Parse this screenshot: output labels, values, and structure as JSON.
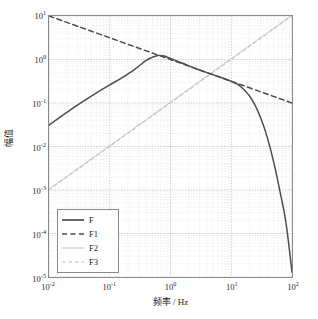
{
  "chart_data": {
    "type": "line",
    "title": "",
    "xlabel": "频率 / Hz",
    "ylabel": "幅值",
    "xscale": "log",
    "yscale": "log",
    "xlim": [
      0.01,
      100
    ],
    "ylim": [
      1e-05,
      10
    ],
    "grid": true,
    "minor_grid": true,
    "legend_position": "lower left",
    "xticks": [
      {
        "value": 0.01,
        "label": "10",
        "exponent": "-2"
      },
      {
        "value": 0.1,
        "label": "10",
        "exponent": "-1"
      },
      {
        "value": 1,
        "label": "10",
        "exponent": "0"
      },
      {
        "value": 10,
        "label": "10",
        "exponent": "1"
      },
      {
        "value": 100,
        "label": "10",
        "exponent": "2"
      }
    ],
    "yticks": [
      {
        "value": 10,
        "label": "10",
        "exponent": "1"
      },
      {
        "value": 1,
        "label": "10",
        "exponent": "0"
      },
      {
        "value": 0.1,
        "label": "10",
        "exponent": "-1"
      },
      {
        "value": 0.01,
        "label": "10",
        "exponent": "-2"
      },
      {
        "value": 0.001,
        "label": "10",
        "exponent": "-3"
      },
      {
        "value": 0.0001,
        "label": "10",
        "exponent": "-4"
      },
      {
        "value": 1e-05,
        "label": "10",
        "exponent": "-5"
      }
    ],
    "series": [
      {
        "name": "F",
        "style": "solid",
        "color": "#4d4d4d",
        "width": 1.5,
        "x": [
          0.01,
          0.0158,
          0.0251,
          0.0398,
          0.0631,
          0.1,
          0.158,
          0.251,
          0.398,
          0.501,
          0.631,
          0.794,
          1.0,
          1.58,
          2.51,
          3.98,
          6.31,
          10.0,
          12.6,
          15.8,
          20.0,
          25.1,
          31.6,
          39.8,
          50.1,
          63.1,
          79.4,
          100.0
        ],
        "y": [
          0.031,
          0.049,
          0.077,
          0.118,
          0.178,
          0.26,
          0.38,
          0.58,
          0.95,
          1.12,
          1.24,
          1.2,
          1.06,
          0.82,
          0.63,
          0.5,
          0.4,
          0.315,
          0.27,
          0.21,
          0.145,
          0.085,
          0.04,
          0.015,
          0.0043,
          0.00095,
          0.00018,
          1.3e-05
        ]
      },
      {
        "name": "F1",
        "style": "dashed",
        "color": "#4d4d4d",
        "width": 1.5,
        "x": [
          0.01,
          0.1,
          1.0,
          10.0,
          100.0
        ],
        "y": [
          10.0,
          3.16,
          1.0,
          0.316,
          0.1
        ]
      },
      {
        "name": "F2",
        "style": "solid",
        "color": "#c8c8c8",
        "width": 1.0,
        "x": [
          0.01,
          0.1,
          1.0,
          10.0,
          100.0
        ],
        "y": [
          0.00105,
          0.0105,
          0.105,
          1.05,
          10.5
        ]
      },
      {
        "name": "F3",
        "style": "dashed",
        "color": "#bebebe",
        "width": 1.0,
        "x": [
          0.01,
          0.1,
          1.0,
          10.0,
          100.0
        ],
        "y": [
          0.001,
          0.01,
          0.1,
          1.0,
          10.0
        ]
      }
    ]
  },
  "legend": {
    "items": [
      {
        "label": "F"
      },
      {
        "label": "F1"
      },
      {
        "label": "F2"
      },
      {
        "label": "F3"
      }
    ]
  },
  "colors": {
    "axis": "#8a8a8a",
    "major_grid": "#b4b4b4",
    "minor_grid": "#d8d8d8",
    "curve_dark": "#4d4d4d",
    "curve_light": "#c8c8c8",
    "text": "#1e1e1e",
    "background": "#ffffff"
  }
}
